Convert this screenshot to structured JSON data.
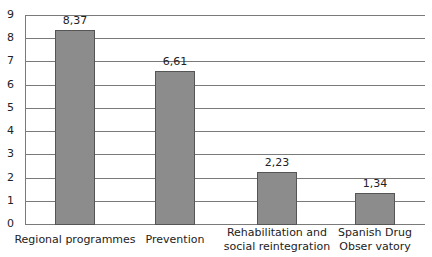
{
  "chart_data": {
    "type": "bar",
    "title": "",
    "xlabel": "",
    "ylabel": "",
    "categories": [
      "Regional programmes",
      "Prevention",
      "Rehabilitation and social reintegration",
      "Spanish Drug Observatory"
    ],
    "category_display": [
      "Regional programmes",
      "Prevention",
      "Rehabilitation and\nsocial reintegration",
      "Spanish Drug\nObser vatory"
    ],
    "values": [
      8.37,
      6.61,
      2.23,
      1.34
    ],
    "value_labels": [
      "8,37",
      "6,61",
      "2,23",
      "1,34"
    ],
    "ylim": [
      0,
      9
    ],
    "yticks": [
      "0",
      "1",
      "2",
      "3",
      "4",
      "5",
      "6",
      "7",
      "8",
      "9"
    ],
    "grid": true,
    "legend": null,
    "colors": {
      "bar_fill": "#8c8c8c",
      "bar_edge": "#555555",
      "grid": "#7a7a7a"
    }
  }
}
